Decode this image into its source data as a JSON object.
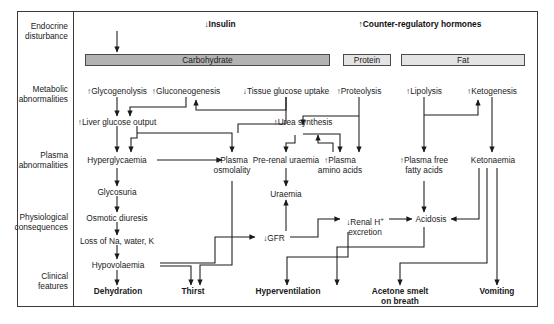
{
  "figure": {
    "title_left": "↓Insulin",
    "title_right": "↑Counter-regulatory hormones"
  },
  "row_labels": [
    {
      "key": "endocrine",
      "line1": "Endocrine",
      "line2": "disturbance"
    },
    {
      "key": "metabolic",
      "line1": "Metabolic",
      "line2": "abnormalities"
    },
    {
      "key": "plasma",
      "line1": "Plasma",
      "line2": "abnormalities"
    },
    {
      "key": "physiological",
      "line1": "Physiological",
      "line2": "consequences"
    },
    {
      "key": "clinical",
      "line1": "Clinical",
      "line2": "features"
    }
  ],
  "category_boxes": [
    {
      "key": "carbohydrate",
      "label": "Carbohydrate",
      "fill": "#b2b2b2"
    },
    {
      "key": "protein",
      "label": "Protein",
      "fill": "#e3e3e3"
    },
    {
      "key": "fat",
      "label": "Fat",
      "fill": "#e3e3e3"
    }
  ],
  "nodes": {
    "glycogenolysis": "↑Glycogenolysis",
    "gluconeogenesis": "↑Gluconeogenesis",
    "tissue_glucose_uptake": "↓Tissue glucose uptake",
    "proteolysis": "↑Proteolysis",
    "lipolysis": "↑Lipolysis",
    "ketogenesis": "↑Ketogenesis",
    "liver_glucose_output": "↑Liver glucose output",
    "urea_synthesis": "↑Urea synthesis",
    "hyperglycaemia": "Hyperglycaemia",
    "plasma_osmolality_l1": "↑Plasma",
    "plasma_osmolality_l2": "osmolality",
    "pre_renal_uraemia": "Pre-renal uraemia",
    "plasma_amino_acids_l1": "↑Plasma",
    "plasma_amino_acids_l2": "amino acids",
    "plasma_ffa_l1": "↑Plasma free",
    "plasma_ffa_l2": "fatty acids",
    "ketonaemia": "Ketonaemia",
    "glycosuria": "Glycosuria",
    "uraemia": "Uraemia",
    "osmotic_diuresis": "Osmotic diuresis",
    "loss_na_water_k": "Loss of Na, water, K",
    "gfr": "↓GFR",
    "renal_h_excretion_l1": "↓Renal H",
    "renal_h_excretion_sup": "+",
    "renal_h_excretion_l2": "excretion",
    "acidosis": "Acidosis",
    "hypovolaemia": "Hypovolaemia",
    "dehydration": "Dehydration",
    "thirst": "Thirst",
    "hyperventilation": "Hyperventilation",
    "acetone_smelt_l1": "Acetone smelt",
    "acetone_smelt_l2": "on breath",
    "vomiting": "Vomiting"
  },
  "colors": {
    "line": "#1a1a1a",
    "frame": "#3a3a3a",
    "box_dark": "#b2b2b2",
    "box_light": "#e3e3e3",
    "text": "#1a1a1a"
  }
}
